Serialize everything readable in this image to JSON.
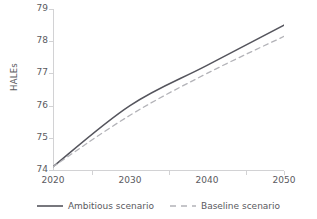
{
  "chart_data": {
    "type": "line",
    "title": "",
    "xlabel": "",
    "ylabel": "HALEs",
    "categories": [
      "2020",
      "2030",
      "2040",
      "2050"
    ],
    "x": [
      2020,
      2030,
      2040,
      2050
    ],
    "ylim": [
      74,
      79
    ],
    "yticks": [
      74,
      75,
      76,
      77,
      78,
      79
    ],
    "ytick_labels": [
      "74",
      "75",
      "76",
      "77",
      "78",
      "79"
    ],
    "grid": false,
    "legend_position": "bottom",
    "series": [
      {
        "name": "Ambitious scenario",
        "values": [
          74.1,
          76.0,
          77.25,
          78.5
        ],
        "color": "#55555d",
        "style": "solid"
      },
      {
        "name": "Baseline scenario",
        "values": [
          74.1,
          75.7,
          77.0,
          78.15
        ],
        "color": "#b3b3b8",
        "style": "dashed"
      }
    ]
  },
  "axes": {
    "y_title": "HALEs",
    "axis_color": "#d2d2d4",
    "tick_color": "#d2d2d4",
    "label_color": "#5a5a60"
  },
  "legend": {
    "items": [
      {
        "label": "Ambitious scenario",
        "marker": "solid-line-swatch"
      },
      {
        "label": "Baseline scenario",
        "marker": "dashed-line-swatch"
      }
    ]
  }
}
